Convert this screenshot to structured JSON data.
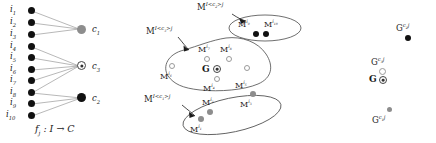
{
  "figure": {
    "panels": [
      "assignment-map",
      "cluster-blobs",
      "centroids"
    ]
  },
  "left_panel": {
    "caption": "f",
    "caption_sub": "j",
    "caption_rest": " : I → C",
    "items": [
      {
        "id": "i1",
        "label": "i",
        "sub": "1"
      },
      {
        "id": "i2",
        "label": "i",
        "sub": "2"
      },
      {
        "id": "i3",
        "label": "i",
        "sub": "3"
      },
      {
        "id": "i4",
        "label": "i",
        "sub": "4"
      },
      {
        "id": "i5",
        "label": "i",
        "sub": "5"
      },
      {
        "id": "i6",
        "label": "i",
        "sub": "6"
      },
      {
        "id": "i7",
        "label": "i",
        "sub": "7"
      },
      {
        "id": "i8",
        "label": "i",
        "sub": "8"
      },
      {
        "id": "i9",
        "label": "i",
        "sub": "9"
      },
      {
        "id": "i10",
        "label": "i",
        "sub": "10"
      }
    ],
    "clusters": [
      {
        "id": "c1",
        "label": "c",
        "sub": "1",
        "marker": "gray-filled"
      },
      {
        "id": "c3",
        "label": "c",
        "sub": "3",
        "marker": "ring-dot"
      },
      {
        "id": "c2",
        "label": "c",
        "sub": "2",
        "marker": "black-filled"
      }
    ],
    "edges": [
      {
        "from": "i1",
        "to": "c1"
      },
      {
        "from": "i2",
        "to": "c1"
      },
      {
        "from": "i3",
        "to": "c1"
      },
      {
        "from": "i4",
        "to": "c3"
      },
      {
        "from": "i5",
        "to": "c3"
      },
      {
        "from": "i6",
        "to": "c3"
      },
      {
        "from": "i7",
        "to": "c3"
      },
      {
        "from": "i8",
        "to": "c3"
      },
      {
        "from": "i8",
        "to": "c2"
      },
      {
        "from": "i9",
        "to": "c2"
      },
      {
        "from": "i10",
        "to": "c2"
      }
    ]
  },
  "middle_panel": {
    "blob_labels": [
      {
        "id": "blob-c2",
        "text": "M",
        "sup": "I<c",
        "sup_sub": "2",
        "sup_tail": ">j"
      },
      {
        "id": "blob-c3",
        "text": "M",
        "sup": "I<c",
        "sup_sub": "3",
        "sup_tail": ">j"
      },
      {
        "id": "blob-c1",
        "text": "M",
        "sup": "I<c",
        "sup_sub": "1",
        "sup_tail": ">j"
      }
    ],
    "points": [
      {
        "id": "Mi9",
        "text": "M",
        "sup": "i",
        "sup_sub": "9",
        "marker": "black-filled"
      },
      {
        "id": "Mi10",
        "text": "M",
        "sup": "i",
        "sup_sub": "10",
        "marker": "black-filled"
      },
      {
        "id": "Mi7",
        "text": "M",
        "sup": "i",
        "sup_sub": "7",
        "marker": "open"
      },
      {
        "id": "Mi8",
        "text": "M",
        "sup": "i",
        "sup_sub": "8",
        "marker": "open"
      },
      {
        "id": "Mi6",
        "text": "M",
        "sup": "i",
        "sup_sub": "6",
        "marker": "open"
      },
      {
        "id": "Mi4",
        "text": "M",
        "sup": "i",
        "sup_sub": "4",
        "marker": "open"
      },
      {
        "id": "Mi5",
        "text": "M",
        "sup": "i",
        "sup_sub": "5",
        "marker": "open"
      },
      {
        "id": "Mi2",
        "text": "M",
        "sup": "i",
        "sup_sub": "2",
        "marker": "gray-filled"
      },
      {
        "id": "Mi3",
        "text": "M",
        "sup": "i",
        "sup_sub": "3",
        "marker": "gray-filled"
      },
      {
        "id": "Mi1",
        "text": "M",
        "sup": "i",
        "sup_sub": "1",
        "marker": "gray-filled"
      }
    ],
    "centroid": {
      "label": "G",
      "marker": "ring-dot"
    }
  },
  "right_panel": {
    "centroids": [
      {
        "id": "Gc2j",
        "text": "G",
        "sup": "c",
        "sup_sub": "2",
        "sup_tail": "j",
        "marker": "black-filled"
      },
      {
        "id": "Gc3j",
        "text": "G",
        "sup": "c",
        "sup_sub": "3",
        "sup_tail": "j",
        "marker": "open"
      },
      {
        "id": "Gc1j",
        "text": "G",
        "sup": "c",
        "sup_sub": "1",
        "sup_tail": "j",
        "marker": "gray-filled"
      }
    ],
    "global": {
      "label": "G",
      "marker": "ring-dot"
    }
  },
  "colors": {
    "ink": "#1a1a1a",
    "edge": "#9a9a9a",
    "gray_marker": "#8d8d8d",
    "black_marker": "#111111",
    "blob_stroke": "#4a4a4a"
  }
}
